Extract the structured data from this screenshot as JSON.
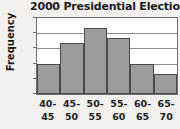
{
  "chart_data": {
    "type": "bar",
    "title": "2000 Presidential Election",
    "xlabel": "",
    "ylabel": "Frequency",
    "categories": [
      "40-45",
      "45-50",
      "50-55",
      "55-60",
      "60-65",
      "65-70"
    ],
    "category_lines": [
      {
        "top": "40-",
        "bottom": "45"
      },
      {
        "top": "45-",
        "bottom": "50"
      },
      {
        "top": "50-",
        "bottom": "55"
      },
      {
        "top": "55-",
        "bottom": "60"
      },
      {
        "top": "60-",
        "bottom": "65"
      },
      {
        "top": "65-",
        "bottom": "70"
      }
    ],
    "values": [
      6,
      10,
      13,
      11,
      6,
      4
    ],
    "ylim": [
      0,
      15
    ],
    "yticks": [
      0,
      3,
      6,
      9,
      12,
      15
    ],
    "ytick_labels": [
      "0",
      "3",
      "6",
      "9",
      "12",
      "15"
    ],
    "grid": true,
    "legend": false,
    "bar_color": "#9c9c9c",
    "bar_border_color": "#4a4a4a",
    "background_color": "#f3f1ef",
    "plot_background_color": "#ffffff",
    "gridline_color": "#8d8d8d",
    "text_color": "#1a1a1a"
  }
}
